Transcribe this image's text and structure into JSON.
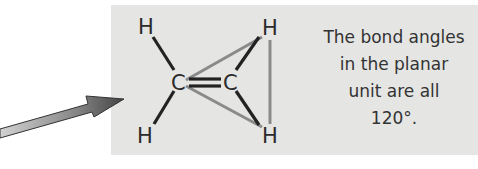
{
  "diagram": {
    "type": "molecule-structure",
    "molecule": "ethene planar unit",
    "atoms": [
      {
        "id": "H1",
        "label": "H",
        "x": 145,
        "y": 34
      },
      {
        "id": "C1",
        "label": "C",
        "x": 178,
        "y": 89
      },
      {
        "id": "C2",
        "label": "C",
        "x": 231,
        "y": 89
      },
      {
        "id": "H2",
        "label": "H",
        "x": 271,
        "y": 35
      },
      {
        "id": "H3",
        "label": "H",
        "x": 145,
        "y": 141
      },
      {
        "id": "H4",
        "label": "H",
        "x": 272,
        "y": 142
      }
    ],
    "bonds": [
      {
        "from": "H1",
        "to": "C1",
        "order": 1
      },
      {
        "from": "H3",
        "to": "C1",
        "order": 1
      },
      {
        "from": "C1",
        "to": "C2",
        "order": 2
      },
      {
        "from": "C2",
        "to": "H2",
        "order": 1
      },
      {
        "from": "C2",
        "to": "H4",
        "order": 1
      }
    ],
    "plane_outline": "gray triangle connecting C, H, H",
    "caption_lines": [
      "The bond angles",
      "in the planar",
      "unit are all",
      "120°."
    ],
    "colors": {
      "panel": "#e5e5e4",
      "bond": "#222222",
      "plane_line": "#8a8a8a",
      "text": "#333333",
      "arrow_light": "#d0d0d0",
      "arrow_dark": "#4a4a4a"
    }
  }
}
